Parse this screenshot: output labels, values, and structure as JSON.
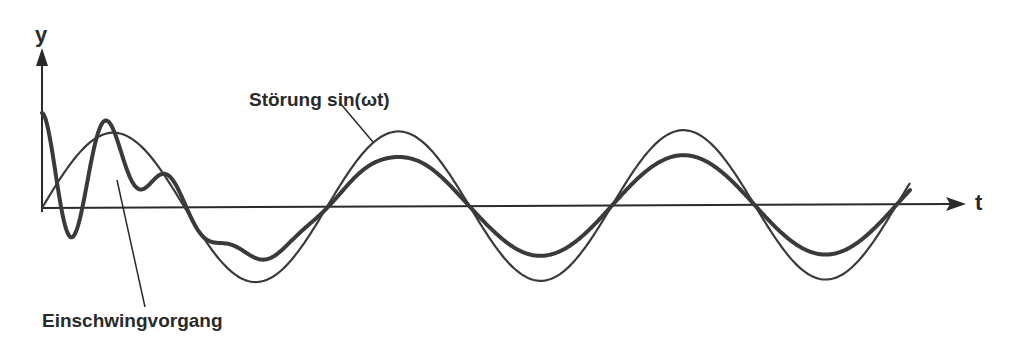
{
  "diagram": {
    "type": "signal-plot",
    "axes": {
      "x_label": "t",
      "y_label": "y"
    },
    "annotations": {
      "disturbance_label": "Störung sin(ωt)",
      "transient_label": "Einschwingvorgang"
    },
    "curves": [
      {
        "name": "Störung sin(ωt)",
        "style": "thin",
        "amplitude_px": 75,
        "half_period_px": 142.5,
        "start_x": 42
      },
      {
        "name": "response",
        "style": "thick",
        "steady_amplitude_px": 50,
        "transient": "damped high-frequency oscillation at start"
      }
    ],
    "colors": {
      "line": "#3a3a3a",
      "axis": "#2a2a2a",
      "background": "#ffffff"
    }
  }
}
